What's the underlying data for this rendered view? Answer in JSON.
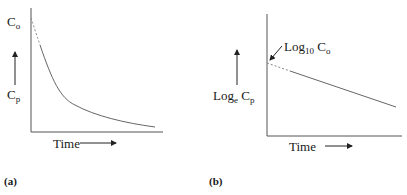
{
  "panels": [
    {
      "id": "a",
      "label": "(a)",
      "y_label_top": {
        "base": "C",
        "sub": "o"
      },
      "y_label": {
        "base": "C",
        "sub": "p"
      },
      "x_label": "Time",
      "curve": "exponential decay from C0 (dashed initial extrapolation) approaching baseline"
    },
    {
      "id": "b",
      "label": "(b)",
      "annotation": {
        "base": "Log",
        "sub": "10",
        "suffix": " C",
        "suffix_sub": "o"
      },
      "y_label": {
        "base": "Log",
        "sub": "e",
        "suffix": " C",
        "suffix_sub": "p"
      },
      "x_label": "Time",
      "curve": "straight line with negative slope; dashed segment at y-intercept"
    }
  ],
  "colors": {
    "axis": "#555555",
    "curve": "#666666",
    "text": "#1a1a1a"
  }
}
